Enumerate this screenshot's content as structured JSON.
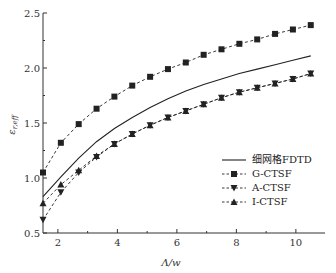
{
  "chart_data": {
    "type": "line",
    "title": "",
    "xlabel": "Λ/w",
    "ylabel": "ε_r,eff",
    "xlim": [
      1.5,
      11
    ],
    "ylim": [
      0.5,
      2.5
    ],
    "xticks": [
      2,
      4,
      6,
      8,
      10
    ],
    "yticks": [
      0.5,
      1.0,
      1.5,
      2.0,
      2.5
    ],
    "ytick_labels": [
      "0.5",
      "1.0",
      "1.5",
      "2.0",
      "2.5"
    ],
    "grid": false,
    "legend_position": "center-right",
    "x": [
      1.5,
      2.1,
      2.7,
      3.3,
      3.9,
      4.5,
      5.1,
      5.7,
      6.3,
      6.9,
      7.5,
      8.1,
      8.7,
      9.3,
      9.9,
      10.5
    ],
    "series": [
      {
        "name": "细网格FDTD",
        "style": "solid",
        "marker": "none",
        "values": [
          0.83,
          1.01,
          1.18,
          1.33,
          1.45,
          1.55,
          1.64,
          1.72,
          1.79,
          1.85,
          1.9,
          1.95,
          1.99,
          2.03,
          2.07,
          2.11
        ]
      },
      {
        "name": "G-CTSF",
        "style": "dashed",
        "marker": "square",
        "values": [
          1.05,
          1.32,
          1.49,
          1.63,
          1.74,
          1.84,
          1.92,
          1.99,
          2.05,
          2.12,
          2.17,
          2.22,
          2.26,
          2.31,
          2.35,
          2.39
        ]
      },
      {
        "name": "A-CTSF",
        "style": "dashed",
        "marker": "triangle-down",
        "values": [
          0.62,
          0.87,
          1.05,
          1.19,
          1.31,
          1.4,
          1.48,
          1.55,
          1.61,
          1.67,
          1.73,
          1.78,
          1.82,
          1.86,
          1.9,
          1.95
        ]
      },
      {
        "name": "I-CTSF",
        "style": "dashed",
        "marker": "triangle-up",
        "values": [
          0.77,
          0.94,
          1.07,
          1.2,
          1.31,
          1.4,
          1.48,
          1.55,
          1.61,
          1.67,
          1.73,
          1.78,
          1.82,
          1.86,
          1.9,
          1.95
        ]
      }
    ]
  },
  "legend": {
    "items": [
      {
        "label": "细网格FDTD"
      },
      {
        "label": "G-CTSF"
      },
      {
        "label": "A-CTSF"
      },
      {
        "label": "I-CTSF"
      }
    ]
  },
  "axes": {
    "x_label": "Λ/w",
    "y_label_main": "ε",
    "y_label_sub": "r,eff"
  },
  "colors": {
    "line": "#222222",
    "axis": "#333333"
  }
}
